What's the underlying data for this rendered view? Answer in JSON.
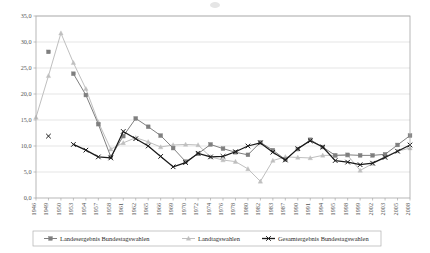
{
  "chart_data": {
    "type": "line",
    "title": "",
    "subtitle": "",
    "xlabel": "",
    "ylabel": "",
    "ylim": [
      0.0,
      35.0
    ],
    "yticks": [
      "0,0",
      "5,0",
      "10,0",
      "15,0",
      "20,0",
      "25,0",
      "30,0",
      "35,0"
    ],
    "ytick_values": [
      0.0,
      5.0,
      10.0,
      15.0,
      20.0,
      25.0,
      30.0,
      35.0
    ],
    "grid": "horizontal",
    "legend_position": "bottom",
    "categories": [
      "1946",
      "1949",
      "1950",
      "1953",
      "1954",
      "1957",
      "1958",
      "1961",
      "1962",
      "1965",
      "1966",
      "1969",
      "1970",
      "1972",
      "1974",
      "1976",
      "1978",
      "1980",
      "1982",
      "1983",
      "1987",
      "1990",
      "1991",
      "1994",
      "1995",
      "1998",
      "1999",
      "2002",
      "2003",
      "2005",
      "2008"
    ],
    "series": [
      {
        "name": "Landesergebnis Bundestagswahlen",
        "color": "#7f7f7f",
        "marker": "square",
        "values": [
          null,
          28.1,
          null,
          23.9,
          19.8,
          14.2,
          7.9,
          11.9,
          15.3,
          13.7,
          12.0,
          9.6,
          7.0,
          8.5,
          10.3,
          9.5,
          8.8,
          8.3,
          10.7,
          9.2,
          7.4,
          9.4,
          11.2,
          9.8,
          8.2,
          8.3,
          8.2,
          8.2,
          8.4,
          10.2,
          12.0
        ]
      },
      {
        "name": "Landtagswahlen",
        "color": "#bfbfbf",
        "marker": "triangle",
        "values": [
          15.5,
          23.5,
          31.7,
          26.0,
          21.0,
          14.6,
          9.4,
          10.6,
          11.6,
          10.8,
          9.8,
          10.2,
          10.3,
          10.2,
          7.9,
          7.3,
          7.0,
          5.6,
          3.2,
          7.2,
          7.9,
          7.8,
          7.7,
          8.2,
          8.2,
          8.2,
          5.3,
          6.6,
          8.0,
          9.0,
          9.6
        ]
      },
      {
        "name": "Gesamtergebnis Bundestagswahlen",
        "color": "#1a1a1a",
        "marker": "cross",
        "values": [
          null,
          11.9,
          null,
          10.3,
          9.2,
          7.9,
          7.7,
          12.8,
          11.4,
          10.0,
          8.0,
          6.0,
          6.8,
          8.6,
          7.9,
          8.0,
          8.9,
          10.0,
          10.6,
          8.8,
          7.3,
          9.5,
          11.0,
          9.8,
          7.2,
          6.9,
          6.4,
          6.7,
          7.8,
          9.0,
          10.2
        ]
      }
    ]
  },
  "legend": {
    "items": [
      {
        "label": "Landesergebnis Bundestagswahlen"
      },
      {
        "label": "Landtagswahlen"
      },
      {
        "label": "Gesamtergebnis Bundestagswahlen"
      }
    ]
  },
  "colors": {
    "series1": "#7f7f7f",
    "series2": "#bfbfbf",
    "series3": "#1a1a1a",
    "grid": "#d4d4d4",
    "frame": "#a6a6a6",
    "background": "#ffffff"
  }
}
